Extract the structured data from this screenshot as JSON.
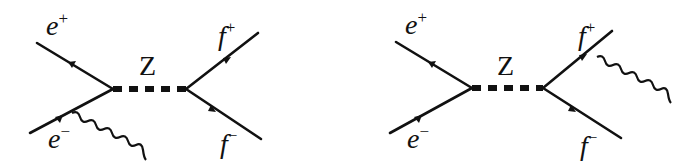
{
  "figure": {
    "diagrams": [
      {
        "id": "initial-state-radiation",
        "labels": {
          "incoming_positron": {
            "base": "e",
            "sup": "+"
          },
          "incoming_electron": {
            "base": "e",
            "sup": "−"
          },
          "propagator": "Z",
          "outgoing_fermion_plus": {
            "base": "f",
            "sup": "+"
          },
          "outgoing_fermion_minus": {
            "base": "f",
            "sup": "−"
          }
        },
        "photon_attached_to": "e−"
      },
      {
        "id": "final-state-radiation",
        "labels": {
          "incoming_positron": {
            "base": "e",
            "sup": "+"
          },
          "incoming_electron": {
            "base": "e",
            "sup": "−"
          },
          "propagator": "Z",
          "outgoing_fermion_plus": {
            "base": "f",
            "sup": "+"
          },
          "outgoing_fermion_minus": {
            "base": "f",
            "sup": "−"
          }
        },
        "photon_attached_to": "f+"
      }
    ],
    "colors": {
      "ink": "#111111",
      "background": "#ffffff"
    }
  }
}
